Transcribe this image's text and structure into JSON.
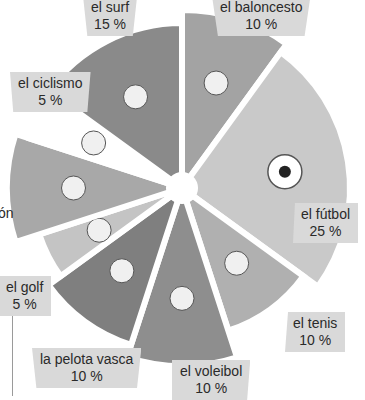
{
  "chart_data": {
    "type": "pie",
    "title": "",
    "categories": [
      "el baloncesto",
      "el fútbol",
      "el tenis",
      "el voleibol",
      "la pelota vasca",
      "el golf",
      "la natación",
      "el ciclismo",
      "el surf"
    ],
    "values": [
      10,
      25,
      10,
      10,
      10,
      5,
      10,
      5,
      15
    ],
    "unit": "%",
    "legend": "inline labels",
    "colors": [
      "#a3a3a3",
      "#c9c9c9",
      "#b0b0b0",
      "#8e8e8e",
      "#7f7f7f",
      "#c4c4c4",
      "#a8a8a8",
      "#ffffff",
      "#8a8a8a"
    ],
    "icons": [
      "basketball-hoop-icon",
      "soccer-ball-icon",
      "tennis-racket-icon",
      "volleyball-hands-icon",
      "jai-alai-cesta-icon",
      "golf-club-icon",
      "swimmer-icon",
      "cyclist-icon",
      "surf-wave-icon"
    ]
  },
  "labels": {
    "baloncesto": {
      "name": "el baloncesto",
      "pct": "10 %"
    },
    "futbol": {
      "name": "el fútbol",
      "pct": "25 %"
    },
    "tenis": {
      "name": "el tenis",
      "pct": "10 %"
    },
    "voleibol": {
      "name": "el voleibol",
      "pct": "10 %"
    },
    "pelota": {
      "name": "la pelota vasca",
      "pct": "10 %"
    },
    "golf": {
      "name": "el golf",
      "pct": "5 %"
    },
    "natacion": {
      "name": "ón",
      "pct": ""
    },
    "ciclismo": {
      "name": "el ciclismo",
      "pct": "5 %"
    },
    "surf": {
      "name": "el surf",
      "pct": "15 %"
    }
  }
}
